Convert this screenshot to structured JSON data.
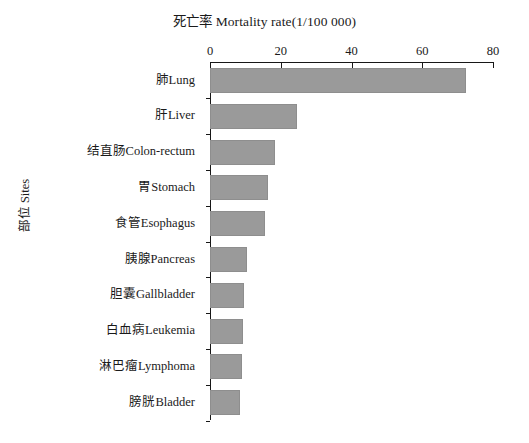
{
  "chart_data": {
    "type": "bar",
    "orientation": "horizontal",
    "title": "死亡率  Mortality rate(1/100 000)",
    "xlabel": "死亡率  Mortality rate(1/100 000)",
    "ylabel": "部位 Sites",
    "xlim": [
      0,
      80
    ],
    "xticks": [
      0,
      20,
      40,
      60,
      80
    ],
    "xtick_labels": [
      "0",
      "20",
      "40",
      "60",
      "80"
    ],
    "grid": false,
    "legend": false,
    "bar_color": "#9a9a9a",
    "axis_color": "#171717",
    "categories": [
      "肺Lung",
      "肝Liver",
      "结直肠Colon-rectum",
      "胃Stomach",
      "食管Esophagus",
      "胰腺Pancreas",
      "胆囊Gallbladder",
      "白血病Leukemia",
      "淋巴瘤Lymphoma",
      "膀胱Bladder"
    ],
    "values": [
      72.5,
      24.6,
      18.4,
      16.4,
      15.6,
      10.5,
      9.6,
      9.3,
      9.0,
      8.5
    ]
  }
}
